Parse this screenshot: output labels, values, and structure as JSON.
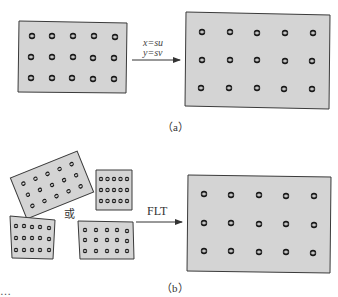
{
  "figure": {
    "panel_a": {
      "caption": "（a）",
      "transform_labels": [
        "x=su",
        "y=sv"
      ],
      "source_grid": {
        "rows": 3,
        "cols": 5
      },
      "target_grid": {
        "rows": 3,
        "cols": 5
      }
    },
    "panel_b": {
      "caption": "（b）",
      "connector_word": "或",
      "transform_label": "FLT",
      "source_shapes": [
        "rotated-rectangle",
        "small-square",
        "trapezoid",
        "skewed-rectangle"
      ],
      "target_grid": {
        "rows": 3,
        "cols": 5
      }
    },
    "colors": {
      "panel_fill": "#d4d4d4",
      "panel_border": "#3a3a3a",
      "dot": "#222222",
      "arrow": "#333333"
    },
    "truncated_footer": "…"
  }
}
